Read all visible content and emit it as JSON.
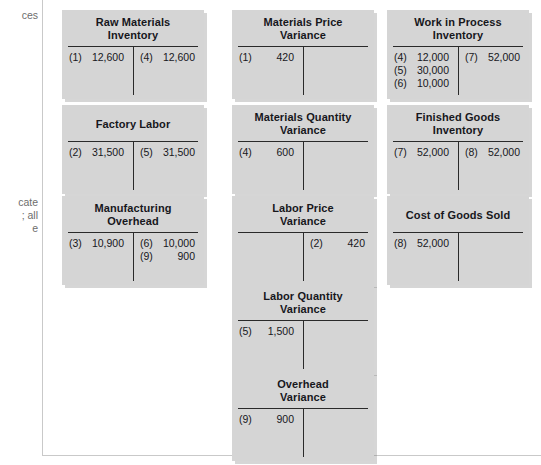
{
  "figure": {
    "background_color": "#ffffff",
    "box_color": "#d5d5d5",
    "rule_color": "#2a2a2a"
  },
  "margin": {
    "note_top": "ces",
    "note_mid": "cate\n; all\ne"
  },
  "accounts": [
    {
      "id": "raw-materials-inventory",
      "title_line1": "Raw Materials",
      "title_line2": "Inventory",
      "x": 62,
      "y": 10,
      "w": 142,
      "debits": [
        {
          "ref": "(1)",
          "amount": "12,600"
        }
      ],
      "credits": [
        {
          "ref": "(4)",
          "amount": "12,600"
        }
      ]
    },
    {
      "id": "factory-labor",
      "title_line1": "Factory Labor",
      "title_line2": "",
      "x": 62,
      "y": 105,
      "w": 142,
      "debits": [
        {
          "ref": "(2)",
          "amount": "31,500"
        }
      ],
      "credits": [
        {
          "ref": "(5)",
          "amount": "31,500"
        }
      ]
    },
    {
      "id": "manufacturing-overhead",
      "title_line1": "Manufacturing",
      "title_line2": "Overhead",
      "x": 62,
      "y": 196,
      "w": 142,
      "debits": [
        {
          "ref": "(3)",
          "amount": "10,900"
        }
      ],
      "credits": [
        {
          "ref": "(6)",
          "amount": "10,000"
        },
        {
          "ref": "(9)",
          "amount": "900"
        }
      ]
    },
    {
      "id": "materials-price-variance",
      "title_line1": "Materials Price",
      "title_line2": "Variance",
      "x": 232,
      "y": 10,
      "w": 142,
      "debits": [
        {
          "ref": "(1)",
          "amount": "420"
        }
      ],
      "credits": []
    },
    {
      "id": "materials-quantity-variance",
      "title_line1": "Materials Quantity",
      "title_line2": "Variance",
      "x": 232,
      "y": 105,
      "w": 142,
      "debits": [
        {
          "ref": "(4)",
          "amount": "600"
        }
      ],
      "credits": []
    },
    {
      "id": "labor-price-variance",
      "title_line1": "Labor Price",
      "title_line2": "Variance",
      "x": 232,
      "y": 196,
      "w": 142,
      "debits": [],
      "credits": [
        {
          "ref": "(2)",
          "amount": "420"
        }
      ]
    },
    {
      "id": "labor-quantity-variance",
      "title_line1": "Labor Quantity",
      "title_line2": "Variance",
      "x": 232,
      "y": 284,
      "w": 142,
      "debits": [
        {
          "ref": "(5)",
          "amount": "1,500"
        }
      ],
      "credits": []
    },
    {
      "id": "overhead-variance",
      "title_line1": "Overhead",
      "title_line2": "Variance",
      "x": 232,
      "y": 372,
      "w": 142,
      "debits": [
        {
          "ref": "(9)",
          "amount": "900"
        }
      ],
      "credits": []
    },
    {
      "id": "work-in-process-inventory",
      "title_line1": "Work in Process",
      "title_line2": "Inventory",
      "x": 387,
      "y": 10,
      "w": 142,
      "debits": [
        {
          "ref": "(4)",
          "amount": "12,000"
        },
        {
          "ref": "(5)",
          "amount": "30,000"
        },
        {
          "ref": "(6)",
          "amount": "10,000"
        }
      ],
      "credits": [
        {
          "ref": "(7)",
          "amount": "52,000"
        }
      ]
    },
    {
      "id": "finished-goods-inventory",
      "title_line1": "Finished Goods",
      "title_line2": "Inventory",
      "x": 387,
      "y": 105,
      "w": 142,
      "debits": [
        {
          "ref": "(7)",
          "amount": "52,000"
        }
      ],
      "credits": [
        {
          "ref": "(8)",
          "amount": "52,000"
        }
      ]
    },
    {
      "id": "cost-of-goods-sold",
      "title_line1": "Cost of Goods Sold",
      "title_line2": "",
      "x": 387,
      "y": 196,
      "w": 142,
      "debits": [
        {
          "ref": "(8)",
          "amount": "52,000"
        }
      ],
      "credits": []
    }
  ]
}
